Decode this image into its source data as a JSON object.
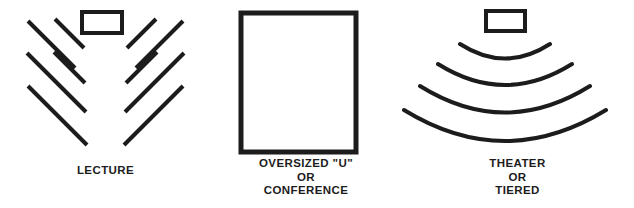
{
  "figure": {
    "background_color": "#ffffff",
    "ink_color": "#1c1c1c",
    "width": 634,
    "height": 208
  },
  "panels": [
    {
      "id": "lecture",
      "caption_lines": [
        "LECTURE"
      ],
      "icon_name": "lecture-seating-diagram",
      "description": "Head table rectangle above two mirrored fans of five diagonal seating rows forming a chevron",
      "stroke_color": "#1c1c1c",
      "podium": {
        "x": 82,
        "y": 12,
        "width": 40,
        "height": 21,
        "stroke_width": 4
      },
      "row_stroke_width": 4,
      "rows_left": [
        {
          "x1": 28,
          "y1": 21,
          "x2": 75,
          "y2": 68
        },
        {
          "x1": 55,
          "y1": 19,
          "x2": 84,
          "y2": 48
        },
        {
          "x1": 27,
          "y1": 53,
          "x2": 86,
          "y2": 112
        },
        {
          "x1": 28,
          "y1": 86,
          "x2": 87,
          "y2": 145
        },
        {
          "x1": 54,
          "y1": 52,
          "x2": 85,
          "y2": 83
        }
      ],
      "rows_right": [
        {
          "x1": 183,
          "y1": 21,
          "x2": 136,
          "y2": 68
        },
        {
          "x1": 156,
          "y1": 19,
          "x2": 127,
          "y2": 48
        },
        {
          "x1": 184,
          "y1": 53,
          "x2": 125,
          "y2": 112
        },
        {
          "x1": 183,
          "y1": 86,
          "x2": 124,
          "y2": 145
        },
        {
          "x1": 157,
          "y1": 52,
          "x2": 126,
          "y2": 83
        }
      ]
    },
    {
      "id": "conference",
      "caption_lines": [
        "OVERSIZED \"U\"",
        "OR",
        "CONFERENCE"
      ],
      "icon_name": "conference-table-diagram",
      "description": "Large open rectangle representing an oversized U or conference table",
      "stroke_color": "#1c1c1c",
      "table": {
        "x": 30,
        "y": 13,
        "width": 115,
        "height": 139,
        "stroke_width": 5
      }
    },
    {
      "id": "theater",
      "caption_lines": [
        "THEATER",
        "OR",
        "TIERED"
      ],
      "icon_name": "theater-tiered-seating-diagram",
      "description": "Stage rectangle above four concentric curved seating arcs",
      "stroke_color": "#1c1c1c",
      "podium": {
        "x": 85,
        "y": 11,
        "width": 39,
        "height": 20,
        "stroke_width": 4
      },
      "arc_stroke_width": 4,
      "arcs": [
        {
          "x1": 59,
          "y1": 44,
          "cx": 104,
          "cy": 73,
          "x2": 149,
          "y2": 44
        },
        {
          "x1": 37,
          "y1": 64,
          "cx": 104,
          "cy": 106,
          "x2": 171,
          "y2": 64
        },
        {
          "x1": 19,
          "y1": 86,
          "cx": 104,
          "cy": 139,
          "x2": 189,
          "y2": 86
        },
        {
          "x1": 3,
          "y1": 110,
          "cx": 104,
          "cy": 172,
          "x2": 205,
          "y2": 110
        }
      ]
    }
  ]
}
